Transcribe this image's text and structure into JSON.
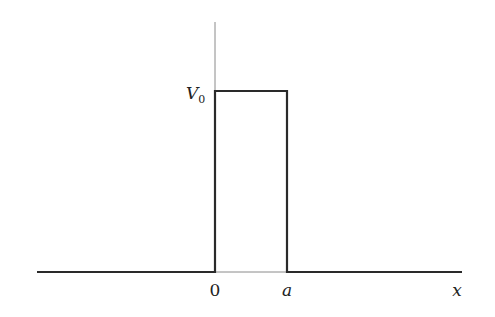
{
  "diagram": {
    "type": "rectangular potential barrier",
    "labels": {
      "potential_height": "V",
      "potential_subscript": "0",
      "origin": "0",
      "barrier_width": "a",
      "x_axis": "x"
    },
    "geometry": {
      "axis_x": 215,
      "axis_top": 22,
      "baseline_y": 272,
      "barrier_top_y": 91,
      "barrier_right_x": 287,
      "line_left_x": 37,
      "line_right_x": 462
    },
    "colors": {
      "potential_line": "#2a2a2a",
      "axis_line": "#8a8a8a",
      "text": "#222222"
    }
  }
}
